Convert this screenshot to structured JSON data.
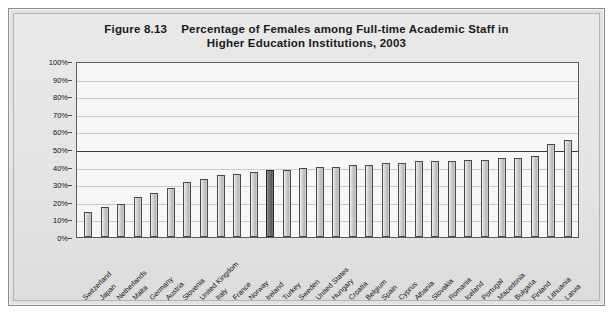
{
  "figure": {
    "number": "Figure 8.13",
    "title_line1": "Percentage of Females among Full-time Academic Staff in",
    "title_line2": "Higher Education Institutions, 2003"
  },
  "chart_data": {
    "type": "bar",
    "xlabel": "",
    "ylabel": "",
    "ylim": [
      0,
      100
    ],
    "yunit": "%",
    "ytick_labels": [
      "100%",
      "90%",
      "80%",
      "70%",
      "60%",
      "50%",
      "40%",
      "30%",
      "20%",
      "10%",
      "0%"
    ],
    "ytick_values": [
      100,
      90,
      80,
      70,
      60,
      50,
      40,
      30,
      20,
      10,
      0
    ],
    "grid": true,
    "major_gridline_at": 50,
    "legend": "none",
    "highlight_category": "Ireland",
    "highlight_color": "#6f6f6f",
    "bar_color": "#d2d2d2",
    "bar_edge_color": "#4a4a4a",
    "categories": [
      "Switzerland",
      "Japan",
      "Netherlands",
      "Malta",
      "Germany",
      "Austria",
      "Slovenia",
      "United Kingdom",
      "Italy",
      "France",
      "Norway",
      "Ireland",
      "Turkey",
      "Sweden",
      "United States",
      "Hungary",
      "Croatia",
      "Belgium",
      "Spain",
      "Cyprus",
      "Albania",
      "Slovakia",
      "Romania",
      "Iceland",
      "Portugal",
      "Macedonia",
      "Bulgaria",
      "Finland",
      "Lithuania",
      "Latvia"
    ],
    "values": [
      14,
      17,
      19,
      23,
      25,
      28,
      31,
      33,
      35,
      36,
      37,
      38,
      38,
      39,
      40,
      40,
      41,
      41,
      42,
      42,
      43,
      43,
      43,
      44,
      44,
      45,
      45,
      46,
      53,
      55
    ],
    "series": [
      {
        "name": "Percentage of females among full-time academic staff",
        "values": [
          14,
          17,
          19,
          23,
          25,
          28,
          31,
          33,
          35,
          36,
          37,
          38,
          38,
          39,
          40,
          40,
          41,
          41,
          42,
          42,
          43,
          43,
          43,
          44,
          44,
          45,
          45,
          46,
          53,
          55
        ]
      }
    ]
  }
}
